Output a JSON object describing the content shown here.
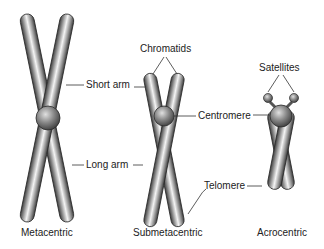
{
  "diagram": {
    "type": "chromosome-types",
    "colors": {
      "chromatid_light": "#f2f2f2",
      "chromatid_dark": "#4a4a4a",
      "line": "#333333",
      "text": "#222222"
    },
    "chromosomes": [
      {
        "name": "Metacentric",
        "labels": [
          "Short arm",
          "Long arm"
        ]
      },
      {
        "name": "Submetacentric",
        "labels": [
          "Chromatids",
          "Centromere",
          "Telomere"
        ]
      },
      {
        "name": "Acrocentric",
        "labels": [
          "Satellites"
        ]
      }
    ],
    "labels": {
      "short_arm": "Short arm",
      "long_arm": "Long arm",
      "chromatids": "Chromatids",
      "centromere": "Centromere",
      "telomere": "Telomere",
      "satellites": "Satellites",
      "metacentric": "Metacentric",
      "submetacentric": "Submetacentric",
      "acrocentric": "Acrocentric"
    }
  }
}
